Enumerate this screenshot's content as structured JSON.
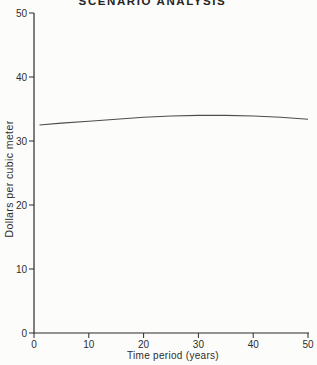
{
  "figure": {
    "background_color": "#fcfcfa",
    "title_color": "#242424"
  },
  "chart_data": {
    "type": "line",
    "title": "SCENARIO ANALYSIS",
    "xlabel": "Time period (years)",
    "ylabel": "Dollars per cubic meter",
    "xlim": [
      0,
      50
    ],
    "ylim": [
      0,
      50
    ],
    "xticks": [
      0,
      10,
      20,
      30,
      40,
      50
    ],
    "yticks": [
      0,
      10,
      20,
      30,
      40,
      50
    ],
    "grid": false,
    "legend": "none",
    "axis_color": "#2b2b2b",
    "line_color": "#4d4d4d",
    "series": [
      {
        "name": "scenario-price-path",
        "x": [
          1,
          5,
          10,
          15,
          20,
          25,
          30,
          35,
          40,
          45,
          50
        ],
        "y": [
          32.5,
          32.8,
          33.1,
          33.4,
          33.7,
          33.9,
          34.0,
          34.0,
          33.9,
          33.7,
          33.4
        ]
      }
    ]
  }
}
